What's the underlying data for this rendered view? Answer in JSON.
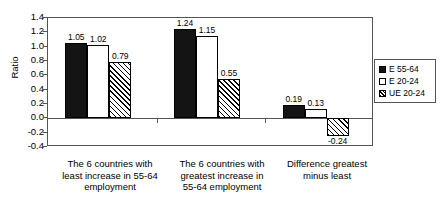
{
  "chart_data": {
    "type": "bar",
    "title": "",
    "xlabel": "",
    "ylabel": "Ratio",
    "ylim": [
      -0.4,
      1.4
    ],
    "ytick_labels": [
      "1.4",
      "1.2",
      "1.0",
      "0.8",
      "0.6",
      "0.4",
      "0.2",
      "0.0",
      "-0.2",
      "-0.4"
    ],
    "ytick_values": [
      1.4,
      1.2,
      1.0,
      0.8,
      0.6,
      0.4,
      0.2,
      0.0,
      -0.2,
      -0.4
    ],
    "grid": false,
    "legend_position": "right",
    "categories": [
      "The 6 countries with least increase in 55-64 employment",
      "The 6 countries with greatest increase in 55-64 employment",
      "Difference greatest minus least"
    ],
    "category_lines": [
      [
        "The 6 countries with",
        "least increase in 55-64",
        "employment"
      ],
      [
        "The 6 countries with",
        "greatest increase in",
        "55-64 employment"
      ],
      [
        "Difference greatest",
        "minus least"
      ]
    ],
    "series": [
      {
        "name": "E 55-64",
        "values": [
          1.05,
          1.24,
          0.19
        ],
        "labels": [
          "1.05",
          "1.24",
          "0.19"
        ],
        "fill": "solid-black",
        "color": "#141414"
      },
      {
        "name": "E 20-24",
        "values": [
          1.02,
          1.15,
          0.13
        ],
        "labels": [
          "1.02",
          "1.15",
          "0.13"
        ],
        "fill": "open-white",
        "color": "#ffffff"
      },
      {
        "name": "UE 20-24",
        "values": [
          0.79,
          0.55,
          -0.24
        ],
        "labels": [
          "0.79",
          "0.55",
          "-0.24"
        ],
        "fill": "diagonal-hatch",
        "color": "#ffffff"
      }
    ]
  },
  "legend": {
    "items": [
      {
        "label": "E 55-64"
      },
      {
        "label": "E 20-24"
      },
      {
        "label": "UE 20-24"
      }
    ]
  }
}
